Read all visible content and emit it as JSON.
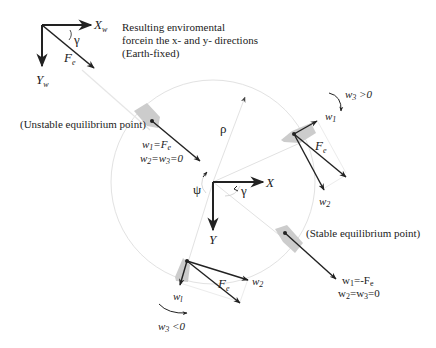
{
  "colors": {
    "ink": "#222222",
    "guide": "#e2e2e2",
    "vessel": "#cccccc",
    "background": "#ffffff"
  },
  "earth_frame": {
    "x_axis": "X",
    "x_sub": "w",
    "y_axis": "Y",
    "y_sub": "w",
    "angle": "γ",
    "force": "F",
    "force_sub": "e",
    "caption_line1": "Resulting enviromental",
    "caption_line2": "forcein the x- and y- directions",
    "caption_line3": "(Earth-fixed)"
  },
  "body_frame": {
    "x_axis": "X",
    "y_axis": "Y",
    "psi": "ψ",
    "gamma": "γ",
    "rho": "ρ"
  },
  "unstable_point": {
    "label": "(Unstable equilibrium point)",
    "eq1": "w",
    "eq1_sub": "1",
    "eq1_rhs": "=F",
    "eq1_rhs_sub": "e",
    "eq2": "w",
    "eq2_sub": "2",
    "eq2_mid": "=w",
    "eq2_mid_sub": "3",
    "eq2_rhs": "=0"
  },
  "stable_point": {
    "label": "(Stable equilibrium point)",
    "eq1": "w",
    "eq1_sub": "1",
    "eq1_rhs": "=-F",
    "eq1_rhs_sub": "e",
    "eq2": "w",
    "eq2_sub": "2",
    "eq2_mid": "=w",
    "eq2_mid_sub": "3",
    "eq2_rhs": "=0"
  },
  "right_vessel": {
    "rotation_label": "w",
    "rotation_sub": "3",
    "rotation_cond": " >0",
    "w1": "w",
    "w1_sub": "1",
    "w2": "w",
    "w2_sub": "2",
    "force": "F",
    "force_sub": "e"
  },
  "bottom_vessel": {
    "rotation_label": "w",
    "rotation_sub": "3",
    "rotation_cond": " <0",
    "w1": "w",
    "w1_sub": "l",
    "w2": "w",
    "w2_sub": "2",
    "force": "F",
    "force_sub": "e"
  }
}
